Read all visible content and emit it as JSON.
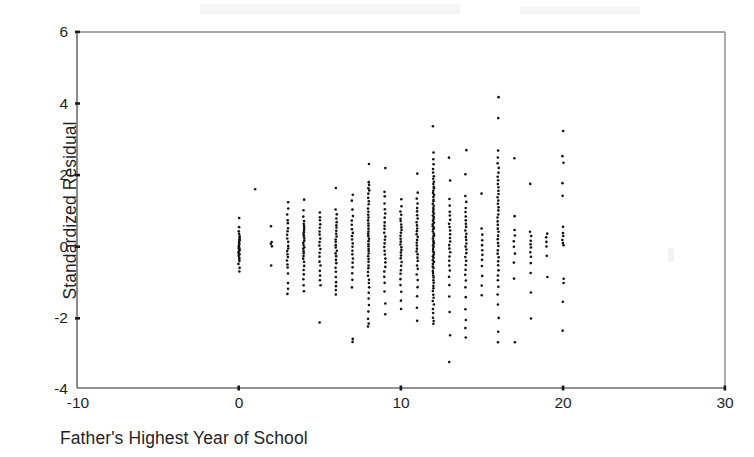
{
  "figure": {
    "kind": "scatterplot",
    "background_color": "#ffffff",
    "frame_color": "#6b6b6b",
    "point_color": "#111111",
    "point_size_px": 2.6
  },
  "axes": {
    "x": {
      "label": "Father's Highest Year of School",
      "ticks": [
        "-10",
        "0",
        "10",
        "20",
        "30"
      ],
      "tick_values": [
        -10,
        0,
        10,
        20,
        30
      ],
      "min": -10,
      "max": 30
    },
    "y": {
      "label": "Standardized Residual",
      "ticks": [
        "6",
        "4",
        "2",
        "0",
        "-2",
        "-4"
      ],
      "tick_values": [
        6,
        4,
        2,
        0,
        -2,
        -4
      ],
      "min": -4,
      "max": 6
    }
  },
  "chart_data": {
    "type": "scatter",
    "title": "",
    "subtitle": "",
    "xlabel": "Father's Highest Year of School",
    "ylabel": "Standardized Residual",
    "xlim": [
      -10,
      30
    ],
    "ylim": [
      -4,
      6
    ],
    "xticks": [
      -10,
      0,
      10,
      20,
      30
    ],
    "yticks": [
      -4,
      -2,
      0,
      2,
      4,
      6
    ],
    "grid": false,
    "legend": false,
    "series": [
      {
        "name": "Standardized Residual",
        "marker": "dot",
        "color": "#111111",
        "columns": [
          {
            "x": 0,
            "n": 26,
            "y_min": -0.72,
            "y_max": 0.78,
            "y": [
              0.78,
              0.52,
              0.4,
              0.33,
              0.27,
              0.22,
              0.18,
              0.14,
              0.1,
              0.06,
              0.02,
              -0.02,
              -0.05,
              -0.08,
              -0.11,
              -0.14,
              -0.17,
              -0.2,
              -0.24,
              -0.28,
              -0.33,
              -0.38,
              -0.44,
              -0.52,
              -0.62,
              -0.72
            ]
          },
          {
            "x": 1,
            "n": 1,
            "y_min": 1.58,
            "y_max": 1.58,
            "y": [
              1.58
            ]
          },
          {
            "x": 2,
            "n": 5,
            "y_min": -0.55,
            "y_max": 0.55,
            "y": [
              0.55,
              0.1,
              0.05,
              -0.02,
              -0.55
            ]
          },
          {
            "x": 3,
            "n": 22,
            "y_min": -1.35,
            "y_max": 1.22,
            "y": [
              1.22,
              1.05,
              0.88,
              0.72,
              0.62,
              0.5,
              0.4,
              0.3,
              0.2,
              0.1,
              0.0,
              -0.08,
              -0.16,
              -0.24,
              -0.32,
              -0.42,
              -0.52,
              -0.62,
              -0.78,
              -1.05,
              -1.2,
              -1.35
            ]
          },
          {
            "x": 4,
            "n": 28,
            "y_min": -1.28,
            "y_max": 1.28,
            "y": [
              1.28,
              1.0,
              0.82,
              0.7,
              0.62,
              0.56,
              0.5,
              0.44,
              0.38,
              0.32,
              0.26,
              0.2,
              0.14,
              0.08,
              0.02,
              -0.04,
              -0.1,
              -0.16,
              -0.22,
              -0.28,
              -0.36,
              -0.46,
              -0.56,
              -0.68,
              -0.8,
              -0.95,
              -1.12,
              -1.28
            ]
          },
          {
            "x": 5,
            "n": 20,
            "y_min": -2.15,
            "y_max": 0.92,
            "y": [
              0.92,
              0.8,
              0.7,
              0.6,
              0.5,
              0.4,
              0.3,
              0.2,
              0.1,
              0.0,
              -0.1,
              -0.2,
              -0.32,
              -0.44,
              -0.56,
              -0.7,
              -0.84,
              -0.98,
              -1.12,
              -2.15
            ]
          },
          {
            "x": 6,
            "n": 26,
            "y_min": -1.38,
            "y_max": 1.62,
            "y": [
              1.62,
              1.02,
              0.88,
              0.76,
              0.66,
              0.58,
              0.5,
              0.42,
              0.34,
              0.26,
              0.18,
              0.1,
              0.02,
              -0.06,
              -0.14,
              -0.22,
              -0.3,
              -0.4,
              -0.5,
              -0.62,
              -0.74,
              -0.88,
              -1.02,
              -1.14,
              -1.26,
              -1.38
            ]
          },
          {
            "x": 7,
            "n": 22,
            "y_min": -2.7,
            "y_max": 1.42,
            "y": [
              1.42,
              1.26,
              1.02,
              0.84,
              0.7,
              0.58,
              0.46,
              0.36,
              0.26,
              0.16,
              0.06,
              -0.04,
              -0.14,
              -0.24,
              -0.36,
              -0.48,
              -0.62,
              -0.78,
              -0.96,
              -1.18,
              -2.62,
              -2.7
            ]
          },
          {
            "x": 8,
            "n": 44,
            "y_min": -2.28,
            "y_max": 2.3,
            "y": [
              2.3,
              1.78,
              1.7,
              1.62,
              1.55,
              1.45,
              1.35,
              1.25,
              1.15,
              1.05,
              0.95,
              0.86,
              0.78,
              0.7,
              0.62,
              0.55,
              0.48,
              0.4,
              0.33,
              0.26,
              0.19,
              0.12,
              0.05,
              -0.02,
              -0.09,
              -0.16,
              -0.23,
              -0.3,
              -0.38,
              -0.46,
              -0.55,
              -0.64,
              -0.74,
              -0.84,
              -0.95,
              -1.06,
              -1.18,
              -1.32,
              -1.48,
              -1.66,
              -1.86,
              -2.05,
              -2.18,
              -2.28
            ]
          },
          {
            "x": 9,
            "n": 26,
            "y_min": -1.92,
            "y_max": 2.18,
            "y": [
              2.18,
              1.52,
              1.38,
              1.18,
              1.02,
              0.9,
              0.78,
              0.66,
              0.56,
              0.46,
              0.36,
              0.26,
              0.16,
              0.06,
              -0.04,
              -0.14,
              -0.25,
              -0.36,
              -0.48,
              -0.6,
              -0.74,
              -0.88,
              -1.04,
              -1.28,
              -1.62,
              -1.92
            ]
          },
          {
            "x": 10,
            "n": 28,
            "y_min": -1.78,
            "y_max": 1.3,
            "y": [
              1.3,
              1.1,
              0.96,
              0.86,
              0.76,
              0.68,
              0.6,
              0.52,
              0.44,
              0.36,
              0.28,
              0.2,
              0.12,
              0.04,
              -0.04,
              -0.12,
              -0.2,
              -0.28,
              -0.36,
              -0.46,
              -0.56,
              -0.68,
              -0.8,
              -0.94,
              -1.1,
              -1.3,
              -1.55,
              -1.78
            ]
          },
          {
            "x": 11,
            "n": 30,
            "y_min": -2.12,
            "y_max": 2.02,
            "y": [
              2.02,
              1.48,
              1.32,
              1.18,
              1.06,
              0.96,
              0.86,
              0.76,
              0.66,
              0.57,
              0.48,
              0.4,
              0.32,
              0.24,
              0.16,
              0.08,
              0.0,
              -0.08,
              -0.16,
              -0.25,
              -0.34,
              -0.44,
              -0.55,
              -0.66,
              -0.8,
              -0.96,
              -1.16,
              -1.42,
              -1.74,
              -2.12
            ]
          },
          {
            "x": 12,
            "n": 72,
            "y_min": -2.2,
            "y_max": 3.36,
            "y": [
              3.36,
              2.62,
              2.42,
              2.28,
              2.16,
              2.06,
              1.96,
              1.88,
              1.8,
              1.73,
              1.66,
              1.6,
              1.54,
              1.48,
              1.42,
              1.36,
              1.3,
              1.24,
              1.18,
              1.12,
              1.06,
              1.0,
              0.95,
              0.9,
              0.85,
              0.8,
              0.75,
              0.7,
              0.65,
              0.6,
              0.55,
              0.5,
              0.45,
              0.4,
              0.35,
              0.3,
              0.25,
              0.2,
              0.15,
              0.1,
              0.05,
              0.0,
              -0.05,
              -0.1,
              -0.15,
              -0.2,
              -0.25,
              -0.3,
              -0.35,
              -0.4,
              -0.46,
              -0.52,
              -0.58,
              -0.64,
              -0.7,
              -0.76,
              -0.83,
              -0.9,
              -0.97,
              -1.04,
              -1.12,
              -1.2,
              -1.28,
              -1.37,
              -1.46,
              -1.56,
              -1.66,
              -1.78,
              -1.9,
              -2.02,
              -2.12,
              -2.2
            ]
          },
          {
            "x": 13,
            "n": 26,
            "y_min": -3.28,
            "y_max": 2.48,
            "y": [
              2.48,
              1.82,
              1.3,
              1.12,
              0.96,
              0.84,
              0.72,
              0.62,
              0.52,
              0.42,
              0.32,
              0.22,
              0.12,
              0.02,
              -0.08,
              -0.18,
              -0.3,
              -0.42,
              -0.55,
              -0.7,
              -0.88,
              -1.1,
              -1.42,
              -1.86,
              -2.52,
              -3.28
            ]
          },
          {
            "x": 14,
            "n": 30,
            "y_min": -2.58,
            "y_max": 2.68,
            "y": [
              2.68,
              2.0,
              1.4,
              1.22,
              1.06,
              0.94,
              0.82,
              0.72,
              0.62,
              0.52,
              0.42,
              0.33,
              0.24,
              0.15,
              0.06,
              -0.03,
              -0.12,
              -0.22,
              -0.32,
              -0.43,
              -0.55,
              -0.68,
              -0.82,
              -0.98,
              -1.18,
              -1.44,
              -1.78,
              -2.08,
              -2.32,
              -2.58
            ]
          },
          {
            "x": 15,
            "n": 12,
            "y_min": -1.4,
            "y_max": 1.46,
            "y": [
              1.46,
              0.48,
              0.3,
              0.16,
              0.02,
              -0.12,
              -0.26,
              -0.4,
              -0.58,
              -0.84,
              -1.12,
              -1.4
            ]
          },
          {
            "x": 16,
            "n": 42,
            "y_min": -2.72,
            "y_max": 4.18,
            "y": [
              4.18,
              3.58,
              2.66,
              2.48,
              2.32,
              2.18,
              2.06,
              1.94,
              1.84,
              1.74,
              1.64,
              1.54,
              1.45,
              1.36,
              1.27,
              1.18,
              1.08,
              0.98,
              0.88,
              0.78,
              0.68,
              0.58,
              0.48,
              0.38,
              0.28,
              0.18,
              0.08,
              -0.02,
              -0.12,
              -0.22,
              -0.33,
              -0.44,
              -0.56,
              -0.69,
              -0.83,
              -0.98,
              -1.16,
              -1.38,
              -1.66,
              -2.02,
              -2.42,
              -2.72
            ]
          },
          {
            "x": 17,
            "n": 10,
            "y_min": -2.72,
            "y_max": 2.46,
            "y": [
              2.46,
              0.82,
              0.44,
              0.28,
              0.12,
              -0.04,
              -0.22,
              -0.48,
              -0.92,
              -2.72
            ]
          },
          {
            "x": 18,
            "n": 12,
            "y_min": -2.04,
            "y_max": 1.74,
            "y": [
              1.74,
              0.38,
              0.26,
              0.14,
              0.04,
              -0.06,
              -0.18,
              -0.32,
              -0.5,
              -0.78,
              -1.32,
              -2.04
            ]
          },
          {
            "x": 19,
            "n": 6,
            "y_min": -0.88,
            "y_max": 0.34,
            "y": [
              0.34,
              0.22,
              0.1,
              -0.02,
              -0.28,
              -0.88
            ]
          },
          {
            "x": 20,
            "n": 16,
            "y_min": -2.38,
            "y_max": 3.22,
            "y": [
              3.22,
              2.52,
              2.34,
              1.76,
              1.4,
              0.52,
              0.36,
              0.26,
              0.16,
              0.08,
              0.0,
              -0.92,
              -1.06,
              -1.58,
              -2.38
            ]
          }
        ]
      }
    ]
  }
}
